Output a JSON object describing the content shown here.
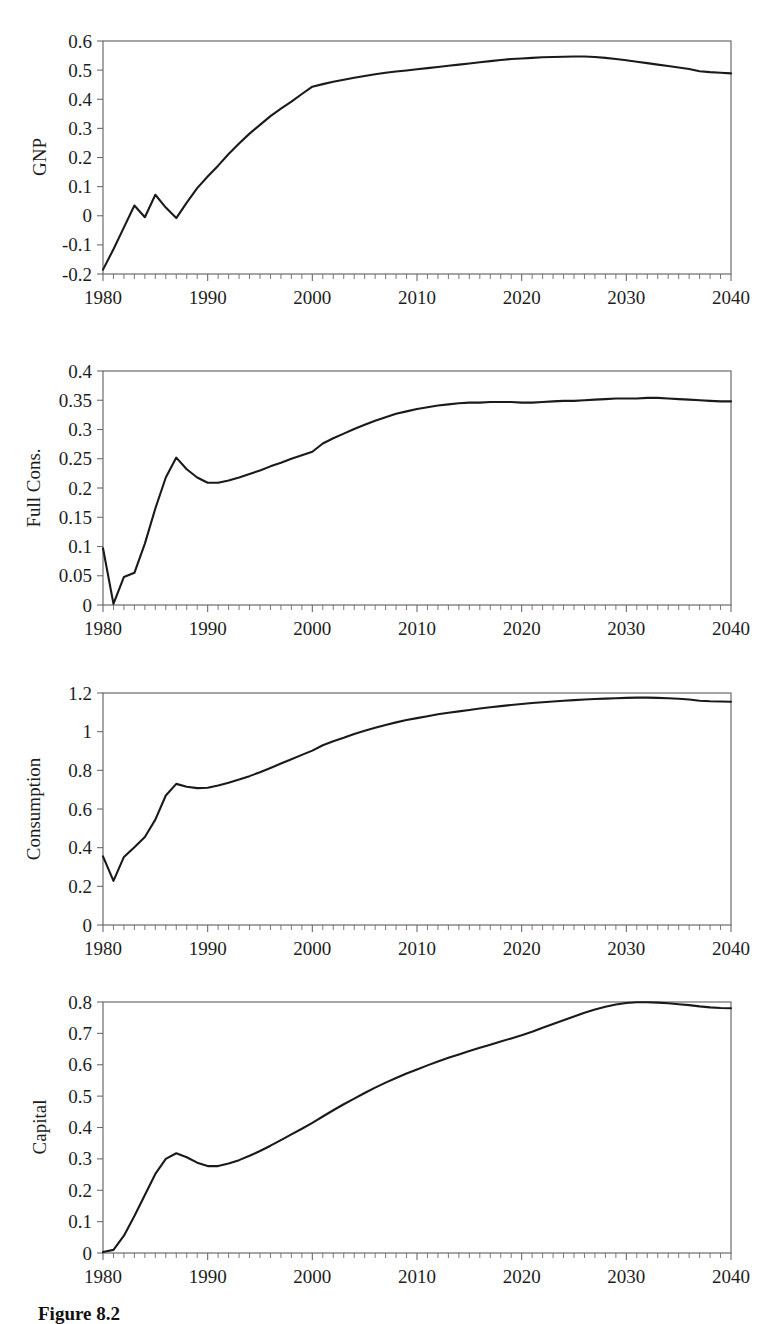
{
  "figure": {
    "caption": "Figure 8.2",
    "line_color": "#1a1a1a",
    "frame_color": "#6b6b6b",
    "background": "#ffffff"
  },
  "chart_data": [
    {
      "type": "line",
      "name": "GNP",
      "title": "",
      "xlabel": "",
      "ylabel": "GNP",
      "xlim": [
        1980,
        2040
      ],
      "ylim": [
        -0.2,
        0.6
      ],
      "xticks": [
        1980,
        1990,
        2000,
        2010,
        2020,
        2030,
        2040
      ],
      "xtick_labels": [
        "1980",
        "1990",
        "2000",
        "2010",
        "2020",
        "2030",
        "2040"
      ],
      "minor_xtick_step": 1,
      "yticks": [
        -0.2,
        -0.1,
        0,
        0.1,
        0.2,
        0.3,
        0.4,
        0.5,
        0.6
      ],
      "ytick_labels": [
        "-0.2",
        "-0.1",
        "0",
        "0.1",
        "0.2",
        "0.3",
        "0.4",
        "0.5",
        "0.6"
      ],
      "grid": false,
      "legend": null,
      "x": [
        1980,
        1981,
        1982,
        1983,
        1984,
        1985,
        1986,
        1987,
        1988,
        1989,
        1990,
        1991,
        1992,
        1993,
        1994,
        1995,
        1996,
        1997,
        1998,
        1999,
        2000,
        2001,
        2002,
        2003,
        2004,
        2005,
        2006,
        2007,
        2008,
        2009,
        2010,
        2011,
        2012,
        2013,
        2014,
        2015,
        2016,
        2017,
        2018,
        2019,
        2020,
        2021,
        2022,
        2023,
        2024,
        2025,
        2026,
        2027,
        2028,
        2029,
        2030,
        2031,
        2032,
        2033,
        2034,
        2035,
        2036,
        2037,
        2038,
        2039,
        2040
      ],
      "y": [
        -0.185,
        -0.115,
        -0.04,
        0.035,
        -0.005,
        0.072,
        0.028,
        -0.008,
        0.045,
        0.095,
        0.135,
        0.172,
        0.212,
        0.248,
        0.282,
        0.312,
        0.342,
        0.368,
        0.392,
        0.418,
        0.443,
        0.452,
        0.46,
        0.467,
        0.474,
        0.48,
        0.486,
        0.491,
        0.495,
        0.499,
        0.503,
        0.507,
        0.511,
        0.515,
        0.519,
        0.523,
        0.527,
        0.531,
        0.535,
        0.538,
        0.54,
        0.542,
        0.544,
        0.545,
        0.546,
        0.547,
        0.547,
        0.545,
        0.542,
        0.538,
        0.534,
        0.529,
        0.524,
        0.519,
        0.514,
        0.509,
        0.504,
        0.496,
        0.493,
        0.491,
        0.489
      ]
    },
    {
      "type": "line",
      "name": "Full Cons.",
      "title": "",
      "xlabel": "",
      "ylabel": "Full Cons.",
      "xlim": [
        1980,
        2040
      ],
      "ylim": [
        0,
        0.4
      ],
      "xticks": [
        1980,
        1990,
        2000,
        2010,
        2020,
        2030,
        2040
      ],
      "xtick_labels": [
        "1980",
        "1990",
        "2000",
        "2010",
        "2020",
        "2030",
        "2040"
      ],
      "minor_xtick_step": 1,
      "yticks": [
        0,
        0.05,
        0.1,
        0.15,
        0.2,
        0.25,
        0.3,
        0.35,
        0.4
      ],
      "ytick_labels": [
        "0",
        "0.05",
        "0.1",
        "0.15",
        "0.2",
        "0.25",
        "0.3",
        "0.35",
        "0.4"
      ],
      "grid": false,
      "legend": null,
      "x": [
        1980,
        1981,
        1982,
        1983,
        1984,
        1985,
        1986,
        1987,
        1988,
        1989,
        1990,
        1991,
        1992,
        1993,
        1994,
        1995,
        1996,
        1997,
        1998,
        1999,
        2000,
        2001,
        2002,
        2003,
        2004,
        2005,
        2006,
        2007,
        2008,
        2009,
        2010,
        2011,
        2012,
        2013,
        2014,
        2015,
        2016,
        2017,
        2018,
        2019,
        2020,
        2021,
        2022,
        2023,
        2024,
        2025,
        2026,
        2027,
        2028,
        2029,
        2030,
        2031,
        2032,
        2033,
        2034,
        2035,
        2036,
        2037,
        2038,
        2039,
        2040
      ],
      "y": [
        0.097,
        0.002,
        0.048,
        0.055,
        0.105,
        0.165,
        0.218,
        0.252,
        0.232,
        0.218,
        0.209,
        0.209,
        0.213,
        0.218,
        0.224,
        0.23,
        0.237,
        0.243,
        0.25,
        0.256,
        0.262,
        0.276,
        0.285,
        0.293,
        0.301,
        0.308,
        0.315,
        0.321,
        0.327,
        0.331,
        0.335,
        0.338,
        0.341,
        0.343,
        0.345,
        0.346,
        0.346,
        0.347,
        0.347,
        0.347,
        0.346,
        0.346,
        0.347,
        0.348,
        0.349,
        0.349,
        0.35,
        0.351,
        0.352,
        0.353,
        0.353,
        0.353,
        0.354,
        0.354,
        0.353,
        0.352,
        0.351,
        0.35,
        0.349,
        0.348,
        0.348
      ]
    },
    {
      "type": "line",
      "name": "Consumption",
      "title": "",
      "xlabel": "",
      "ylabel": "Consumption",
      "xlim": [
        1980,
        2040
      ],
      "ylim": [
        0,
        1.2
      ],
      "xticks": [
        1980,
        1990,
        2000,
        2010,
        2020,
        2030,
        2040
      ],
      "xtick_labels": [
        "1980",
        "1990",
        "2000",
        "2010",
        "2020",
        "2030",
        "2040"
      ],
      "minor_xtick_step": 1,
      "yticks": [
        0,
        0.2,
        0.4,
        0.6,
        0.8,
        1.0,
        1.2
      ],
      "ytick_labels": [
        "0",
        "0.2",
        "0.4",
        "0.6",
        "0.8",
        "1",
        "1.2"
      ],
      "grid": false,
      "legend": null,
      "x": [
        1980,
        1981,
        1982,
        1983,
        1984,
        1985,
        1986,
        1987,
        1988,
        1989,
        1990,
        1991,
        1992,
        1993,
        1994,
        1995,
        1996,
        1997,
        1998,
        1999,
        2000,
        2001,
        2002,
        2003,
        2004,
        2005,
        2006,
        2007,
        2008,
        2009,
        2010,
        2011,
        2012,
        2013,
        2014,
        2015,
        2016,
        2017,
        2018,
        2019,
        2020,
        2021,
        2022,
        2023,
        2024,
        2025,
        2026,
        2027,
        2028,
        2029,
        2030,
        2031,
        2032,
        2033,
        2034,
        2035,
        2036,
        2037,
        2038,
        2039,
        2040
      ],
      "y": [
        0.355,
        0.228,
        0.352,
        0.402,
        0.455,
        0.545,
        0.67,
        0.73,
        0.715,
        0.708,
        0.71,
        0.722,
        0.736,
        0.752,
        0.77,
        0.79,
        0.812,
        0.835,
        0.857,
        0.88,
        0.902,
        0.93,
        0.95,
        0.968,
        0.988,
        1.005,
        1.02,
        1.035,
        1.048,
        1.06,
        1.07,
        1.08,
        1.09,
        1.098,
        1.105,
        1.112,
        1.12,
        1.126,
        1.132,
        1.138,
        1.143,
        1.148,
        1.152,
        1.156,
        1.16,
        1.163,
        1.166,
        1.169,
        1.171,
        1.173,
        1.175,
        1.176,
        1.176,
        1.175,
        1.173,
        1.17,
        1.166,
        1.16,
        1.157,
        1.156,
        1.155
      ]
    },
    {
      "type": "line",
      "name": "Capital",
      "title": "",
      "xlabel": "",
      "ylabel": "Capital",
      "xlim": [
        1980,
        2040
      ],
      "ylim": [
        0,
        0.8
      ],
      "xticks": [
        1980,
        1990,
        2000,
        2010,
        2020,
        2030,
        2040
      ],
      "xtick_labels": [
        "1980",
        "1990",
        "2000",
        "2010",
        "2020",
        "2030",
        "2040"
      ],
      "minor_xtick_step": 1,
      "yticks": [
        0,
        0.1,
        0.2,
        0.3,
        0.4,
        0.5,
        0.6,
        0.7,
        0.8
      ],
      "ytick_labels": [
        "0",
        "0.1",
        "0.2",
        "0.3",
        "0.4",
        "0.5",
        "0.6",
        "0.7",
        "0.8"
      ],
      "grid": false,
      "legend": null,
      "x": [
        1980,
        1981,
        1982,
        1983,
        1984,
        1985,
        1986,
        1987,
        1988,
        1989,
        1990,
        1991,
        1992,
        1993,
        1994,
        1995,
        1996,
        1997,
        1998,
        1999,
        2000,
        2001,
        2002,
        2003,
        2004,
        2005,
        2006,
        2007,
        2008,
        2009,
        2010,
        2011,
        2012,
        2013,
        2014,
        2015,
        2016,
        2017,
        2018,
        2019,
        2020,
        2021,
        2022,
        2023,
        2024,
        2025,
        2026,
        2027,
        2028,
        2029,
        2030,
        2031,
        2032,
        2033,
        2034,
        2035,
        2036,
        2037,
        2038,
        2039,
        2040
      ],
      "y": [
        0.003,
        0.01,
        0.055,
        0.118,
        0.185,
        0.252,
        0.3,
        0.318,
        0.305,
        0.288,
        0.277,
        0.277,
        0.285,
        0.296,
        0.31,
        0.325,
        0.342,
        0.36,
        0.378,
        0.396,
        0.415,
        0.435,
        0.455,
        0.474,
        0.492,
        0.51,
        0.527,
        0.543,
        0.558,
        0.572,
        0.585,
        0.598,
        0.61,
        0.622,
        0.633,
        0.644,
        0.654,
        0.664,
        0.674,
        0.684,
        0.694,
        0.705,
        0.718,
        0.73,
        0.742,
        0.754,
        0.766,
        0.776,
        0.785,
        0.792,
        0.797,
        0.799,
        0.799,
        0.798,
        0.796,
        0.793,
        0.79,
        0.786,
        0.783,
        0.781,
        0.78
      ]
    }
  ]
}
